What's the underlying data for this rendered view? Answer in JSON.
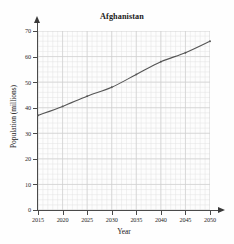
{
  "chart_data": {
    "type": "line",
    "title": "Afghanistan",
    "xlabel": "Year",
    "ylabel": "Population (millions)",
    "x": [
      2015,
      2020,
      2025,
      2030,
      2035,
      2040,
      2045,
      2050
    ],
    "values": [
      37,
      40.5,
      44.5,
      48,
      53,
      58,
      61.5,
      66
    ],
    "series": [
      {
        "name": "Population",
        "values": [
          37,
          40.5,
          44.5,
          48,
          53,
          58,
          61.5,
          66
        ]
      }
    ],
    "xlim": [
      2015,
      2050
    ],
    "ylim": [
      0,
      70
    ],
    "xticks": [
      2015,
      2020,
      2025,
      2030,
      2035,
      2040,
      2045,
      2050
    ],
    "xtick_labels": [
      "2015",
      "2020",
      "2025",
      "2030",
      "2035",
      "2040",
      "2045",
      "2050"
    ],
    "yticks": [
      0,
      10,
      20,
      30,
      40,
      50,
      60,
      70
    ],
    "ytick_labels": [
      "0",
      "10",
      "20",
      "30",
      "40",
      "50",
      "60",
      "70"
    ],
    "grid": true,
    "grid_minor": true,
    "legend": "none",
    "line_color": "#555555",
    "grid_color": "#e2e2e2",
    "grid_major_color": "#cfcfcf",
    "axis_color": "#4a4a4a",
    "background_color": "#fdfdfd"
  }
}
